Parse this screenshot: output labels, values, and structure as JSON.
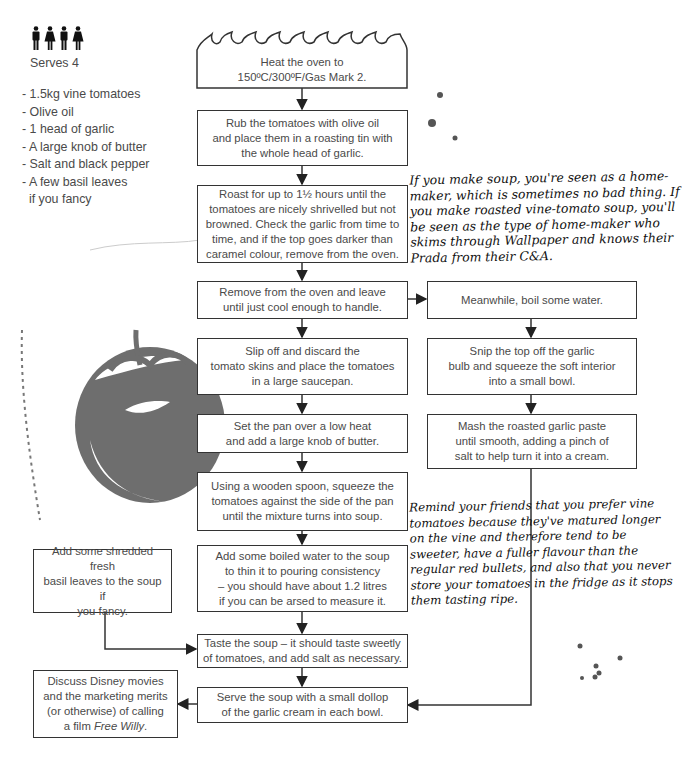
{
  "recipe": {
    "serves_label": "Serves 4",
    "people_icons": [
      "man-icon",
      "woman-icon",
      "man-icon",
      "woman-icon"
    ],
    "ingredients": [
      "- 1.5kg vine tomatoes",
      "- Olive oil",
      "- 1 head of garlic",
      "- A large knob of butter",
      "- Salt and black pepper",
      "- A few basil leaves",
      "  if you fancy"
    ]
  },
  "flowchart": {
    "oven": "Heat the oven to\n150ºC/300ºF/Gas Mark 2.",
    "rub": "Rub the tomatoes with olive oil\nand place them in a roasting tin with\nthe whole head of garlic.",
    "roast": "Roast for up to 1½ hours until the\ntomatoes are nicely shrivelled but not\nbrowned. Check the garlic from time to\ntime, and if the top goes darker than\ncaramel colour, remove from the oven.",
    "remove": "Remove from the oven and leave\nuntil just cool enough to handle.",
    "meanwhile": "Meanwhile, boil some water.",
    "slip": "Slip off and discard the\ntomato skins and place the tomatoes\nin a large saucepan.",
    "snip": "Snip the top off the garlic\nbulb and squeeze the soft interior\ninto a small bowl.",
    "set_pan": "Set the pan over a low heat\nand add a large knob of butter.",
    "mash": "Mash the roasted garlic paste\nuntil smooth, adding a pinch of\nsalt to help turn it into a cream.",
    "spoon": "Using a wooden spoon, squeeze the\ntomatoes against the side of the pan\nuntil the mixture turns into soup.",
    "water": "Add some boiled water to the soup\nto thin it to pouring consistency\n– you should have about 1.2 litres\nif you can be arsed to measure it.",
    "basil": "Add some shredded fresh\nbasil leaves to the soup if\nyou fancy.",
    "taste": "Taste the soup – it should taste sweetly\nof tomatoes, and add salt as necessary.",
    "serve": "Serve the soup with a small dollop\nof the garlic cream in each bowl.",
    "discuss_main": "Discuss Disney movies\nand the marketing merits\n(or otherwise) of calling\na film ",
    "discuss_italic": "Free Willy",
    "discuss_end": "."
  },
  "notes": {
    "homemaker": "If you make soup, you're seen as a home-\nmaker, which is sometimes no bad thing. If\nyou make roasted vine-tomato soup, you'll\nbe seen as the type of home-maker who\nskims through Wallpaper and knows their\nPrada from their C&A.",
    "vine": "Remind your friends that you prefer vine\ntomatoes because they've matured longer\non the vine and therefore tend to be\nsweeter, have a fuller flavour than the\nregular red bullets, and also that you never\nstore your tomatoes in the fridge as it stops\nthem tasting ripe."
  },
  "illustration": {
    "name": "tomato",
    "color": "#6e6e6e"
  }
}
